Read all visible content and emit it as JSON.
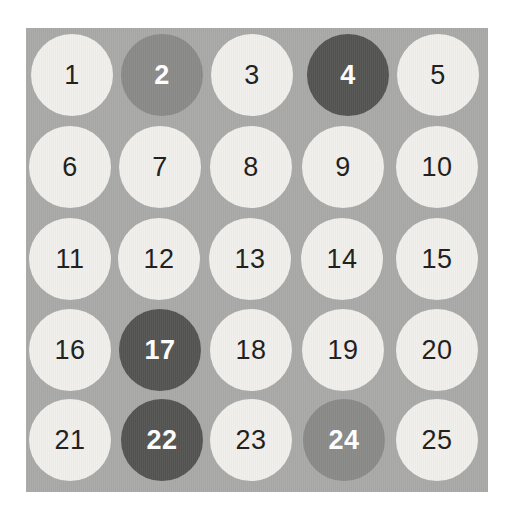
{
  "panel": {
    "background_color": "#a9a9a7",
    "rows": 5,
    "columns": 5
  },
  "legend": {
    "light_fill": "#f0efec",
    "light_text": "#1d1d1b",
    "medium_fill": "#8a8a88",
    "medium_text": "#ffffff",
    "dark_fill": "#545452",
    "dark_text": "#ffffff"
  },
  "grid": {
    "rows": [
      {
        "cells": [
          {
            "label": "1",
            "state": "light"
          },
          {
            "label": "2",
            "state": "medium"
          },
          {
            "label": "3",
            "state": "light"
          },
          {
            "label": "4",
            "state": "dark"
          },
          {
            "label": "5",
            "state": "light"
          }
        ]
      },
      {
        "cells": [
          {
            "label": "6",
            "state": "light"
          },
          {
            "label": "7",
            "state": "light"
          },
          {
            "label": "8",
            "state": "light"
          },
          {
            "label": "9",
            "state": "light"
          },
          {
            "label": "10",
            "state": "light"
          }
        ]
      },
      {
        "cells": [
          {
            "label": "11",
            "state": "light"
          },
          {
            "label": "12",
            "state": "light"
          },
          {
            "label": "13",
            "state": "light"
          },
          {
            "label": "14",
            "state": "light"
          },
          {
            "label": "15",
            "state": "light"
          }
        ]
      },
      {
        "cells": [
          {
            "label": "16",
            "state": "light"
          },
          {
            "label": "17",
            "state": "dark"
          },
          {
            "label": "18",
            "state": "light"
          },
          {
            "label": "19",
            "state": "light"
          },
          {
            "label": "20",
            "state": "light"
          }
        ]
      },
      {
        "cells": [
          {
            "label": "21",
            "state": "light"
          },
          {
            "label": "22",
            "state": "dark"
          },
          {
            "label": "23",
            "state": "light"
          },
          {
            "label": "24",
            "state": "medium"
          },
          {
            "label": "25",
            "state": "light"
          }
        ]
      }
    ]
  }
}
